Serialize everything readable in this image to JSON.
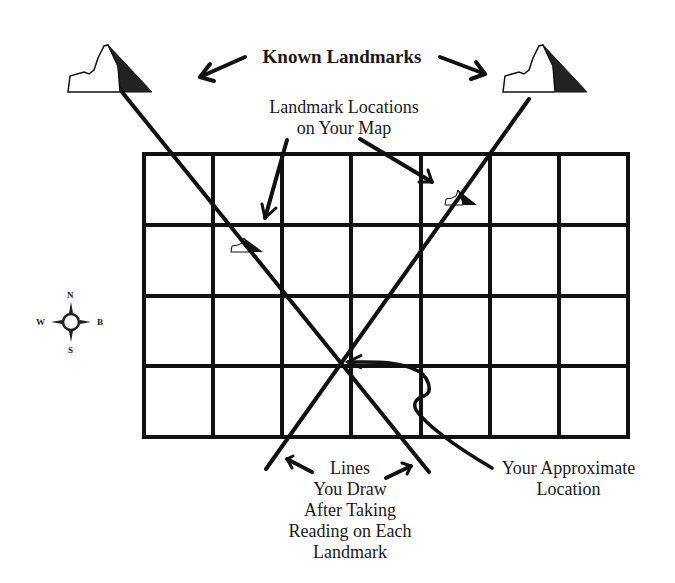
{
  "diagram": {
    "title": "Known Landmarks",
    "labels": {
      "landmark_locations_line1": "Landmark Locations",
      "landmark_locations_line2": "on Your Map",
      "lines_you_draw": [
        "Lines",
        "You Draw",
        "After Taking",
        "Reading on Each",
        "Landmark"
      ],
      "approx_location_line1": "Your Approximate",
      "approx_location_line2": "Location"
    },
    "compass": {
      "north": "N",
      "south": "S",
      "west": "W",
      "east": "B"
    },
    "grid": {
      "columns": 7,
      "rows": 4
    },
    "colors": {
      "ink": "#111111",
      "background": "#ffffff",
      "mountain_shade": "#222222"
    }
  }
}
